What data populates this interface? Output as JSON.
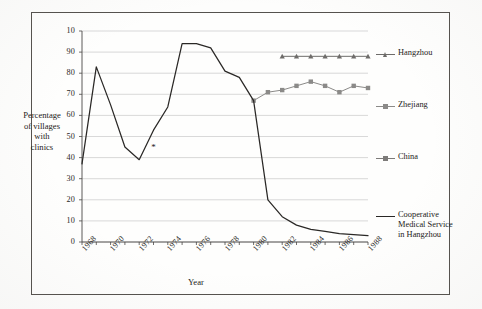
{
  "chart_data": {
    "type": "line",
    "title": "",
    "xlabel": "Year",
    "ylabel": "Percentage of villages with clinics",
    "ylabel_lines": [
      "Percentage",
      "of villages",
      "with",
      "clinics"
    ],
    "xlim": [
      1968,
      1988
    ],
    "ylim": [
      0,
      100
    ],
    "grid": true,
    "grid_axis": "y",
    "legend_position": "right",
    "ytick_labels": [
      "10",
      "90",
      "80",
      "70",
      "60",
      "50",
      "40",
      "30",
      "20",
      "10",
      "0"
    ],
    "ytick_values": [
      100,
      90,
      80,
      70,
      60,
      50,
      40,
      30,
      20,
      10,
      0
    ],
    "xtick_labels": [
      "1968",
      "1970",
      "1972",
      "1974",
      "1976",
      "1978",
      "1980",
      "1982",
      "1984",
      "1986",
      "1988"
    ],
    "xtick_values": [
      1968,
      1970,
      1972,
      1974,
      1976,
      1978,
      1980,
      1982,
      1984,
      1986,
      1988
    ],
    "series": [
      {
        "name": "Hangzhou",
        "color": "#6e6c6a",
        "marker": "triangle",
        "x": [
          1982,
          1983,
          1984,
          1985,
          1986,
          1987,
          1988
        ],
        "values": [
          88,
          88,
          88,
          88,
          88,
          88,
          88
        ]
      },
      {
        "name": "Zhejiang",
        "color": "#8b8a88",
        "marker": "square",
        "x": [
          1980,
          1981,
          1982,
          1983,
          1984,
          1985,
          1986,
          1987,
          1988
        ],
        "values": [
          67,
          71,
          72,
          74,
          76,
          74,
          71,
          74,
          73
        ]
      },
      {
        "name": "China",
        "color": "#7d7b79",
        "marker": "square",
        "x": [],
        "values": []
      },
      {
        "name": "Cooperative Medical Service in Hangzhou",
        "name_lines": [
          "Cooperative",
          "Medical Service",
          "in Hangzhou"
        ],
        "color": "#2a2826",
        "marker": "none",
        "x": [
          1968,
          1969,
          1970,
          1971,
          1972,
          1973,
          1974,
          1975,
          1976,
          1977,
          1978,
          1979,
          1980,
          1981,
          1982,
          1983,
          1984,
          1985,
          1986,
          1987,
          1988
        ],
        "values": [
          37,
          83,
          65,
          45,
          39,
          53,
          64,
          94,
          94,
          92,
          81,
          78,
          67,
          20,
          12,
          8,
          6,
          5,
          4,
          3.5,
          3
        ]
      }
    ],
    "annotations": [
      {
        "name": "asterisk-marker",
        "symbol": "*",
        "x": 1973,
        "y": 45
      }
    ]
  },
  "legend": {
    "items": [
      {
        "label": "Hangzhou",
        "color": "#6e6c6a",
        "marker": "triangle"
      },
      {
        "label": "Zhejiang",
        "color": "#8b8a88",
        "marker": "square"
      },
      {
        "label": "China",
        "color": "#7d7b79",
        "marker": "square"
      },
      {
        "label": "Cooperative\nMedical Service\nin Hangzhou",
        "color": "#2a2826",
        "marker": "line"
      }
    ]
  },
  "colors": {
    "frame": "#55524e",
    "axis": "#4a4845",
    "grid": "#c9c9c9",
    "text": "#232120",
    "page": "#fefefd"
  }
}
